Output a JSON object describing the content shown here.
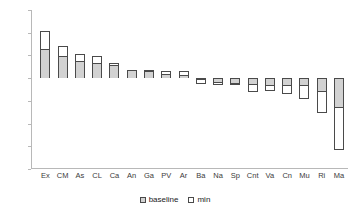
{
  "chart_data": {
    "type": "bar",
    "title": "",
    "subtitle": "",
    "xlabel": "",
    "ylabel": "",
    "ylim": [
      -20,
      15
    ],
    "ytick_labels": [
      "15%",
      "10%",
      "5%",
      "0%",
      "-5%",
      "-10%",
      "-15%",
      "-20%"
    ],
    "ytick_values": [
      15,
      10,
      5,
      0,
      -5,
      -10,
      -15,
      -20
    ],
    "grid": false,
    "legend_position": "bottom",
    "legend": [
      "baseline",
      "min"
    ],
    "categories": [
      "Ex",
      "CM",
      "As",
      "CL",
      "Ca",
      "An",
      "Ga",
      "PV",
      "Ar",
      "Ba",
      "Na",
      "Sp",
      "Cnt",
      "Va",
      "Cn",
      "Mu",
      "Ri",
      "Ma"
    ],
    "series": [
      {
        "name": "baseline",
        "values": [
          6.4,
          4.8,
          3.8,
          3.4,
          2.8,
          1.7,
          1.5,
          0.9,
          0.6,
          -0.2,
          -0.9,
          -1.0,
          -1.3,
          -1.4,
          -1.5,
          -1.6,
          -2.9,
          -6.4
        ]
      },
      {
        "name": "min",
        "values": [
          10.3,
          7.0,
          5.3,
          4.8,
          3.3,
          1.9,
          1.9,
          1.6,
          1.5,
          0.0,
          0.0,
          0.0,
          0.0,
          0.0,
          0.0,
          0.0,
          0.0,
          0.0
        ]
      },
      {
        "name": "lower",
        "values": [
          0.0,
          0.0,
          0.0,
          0.0,
          0.0,
          0.0,
          0.0,
          0.0,
          0.0,
          -1.2,
          -1.6,
          -1.6,
          -3.0,
          -2.9,
          -3.6,
          -4.6,
          -7.7,
          -15.9
        ]
      }
    ]
  },
  "colors": {
    "bar_border": "#4a4a4a",
    "bar_fill": "#d2d2d2",
    "bar_white": "#ffffff",
    "axis": "#b8b8b8",
    "text": "#3a3a3a",
    "background": "#ffffff"
  }
}
